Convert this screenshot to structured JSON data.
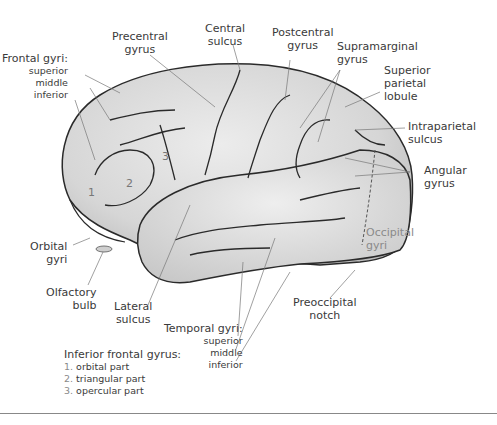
{
  "figure": {
    "labels": {
      "precentral_gyrus": [
        "Precentral",
        "gyrus"
      ],
      "central_sulcus": [
        "Central",
        "sulcus"
      ],
      "postcentral_gyrus": [
        "Postcentral",
        "gyrus"
      ],
      "supramarginal_gyrus": [
        "Supramarginal",
        "gyrus"
      ],
      "superior_parietal_lobule": [
        "Superior",
        "parietal",
        "lobule"
      ],
      "intraparietal_sulcus": [
        "Intraparietal",
        "sulcus"
      ],
      "angular_gyrus": [
        "Angular",
        "gyrus"
      ],
      "occipital_gyri": [
        "Occipital",
        "gyri"
      ],
      "preoccipital_notch": [
        "Preoccipital",
        "notch"
      ],
      "frontal_gyri": {
        "title": "Frontal gyri:",
        "items": [
          "superior",
          "middle",
          "inferior"
        ]
      },
      "orbital_gyri": [
        "Orbital",
        "gyri"
      ],
      "olfactory_bulb": [
        "Olfactory",
        "bulb"
      ],
      "lateral_sulcus": [
        "Lateral",
        "sulcus"
      ],
      "temporal_gyri": {
        "title": "Temporal gyri:",
        "items": [
          "superior",
          "middle",
          "inferior"
        ]
      }
    },
    "inferior_frontal_gyrus": {
      "title": "Inferior frontal gyrus:",
      "parts": [
        {
          "num": "1.",
          "label": "orbital part"
        },
        {
          "num": "2.",
          "label": "triangular part"
        },
        {
          "num": "3.",
          "label": "opercular part"
        }
      ]
    },
    "region_numbers": [
      "1",
      "2",
      "3"
    ],
    "colors": {
      "brain_fill": "#d9d9d9",
      "outline": "#2a2a2a",
      "leader": "#777777",
      "text": "#3a3a3a"
    }
  }
}
